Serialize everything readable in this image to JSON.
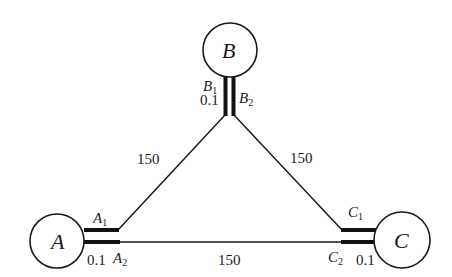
{
  "diagram": {
    "nodes": [
      {
        "id": "A",
        "label": "A",
        "cx": 57,
        "cy": 241,
        "r": 27
      },
      {
        "id": "B",
        "label": "B",
        "cx": 230,
        "cy": 50,
        "r": 27
      },
      {
        "id": "C",
        "label": "C",
        "cx": 402,
        "cy": 240,
        "r": 28
      }
    ],
    "ports": {
      "A1": {
        "letter": "A",
        "sub": "1"
      },
      "A2": {
        "letter": "A",
        "sub": "2"
      },
      "B1": {
        "letter": "B",
        "sub": "1"
      },
      "B2": {
        "letter": "B",
        "sub": "2"
      },
      "C1": {
        "letter": "C",
        "sub": "1"
      },
      "C2": {
        "letter": "C",
        "sub": "2"
      }
    },
    "stub_lengths": {
      "A": "0.1",
      "B": "0.1",
      "C": "0.1"
    },
    "edges": [
      {
        "from": "B1",
        "to": "A1",
        "length": "150"
      },
      {
        "from": "B2",
        "to": "C1",
        "length": "150"
      },
      {
        "from": "A2",
        "to": "C2",
        "length": "150"
      }
    ],
    "colors": {
      "stroke": "#1a1a1a",
      "background": "#ffffff"
    }
  }
}
